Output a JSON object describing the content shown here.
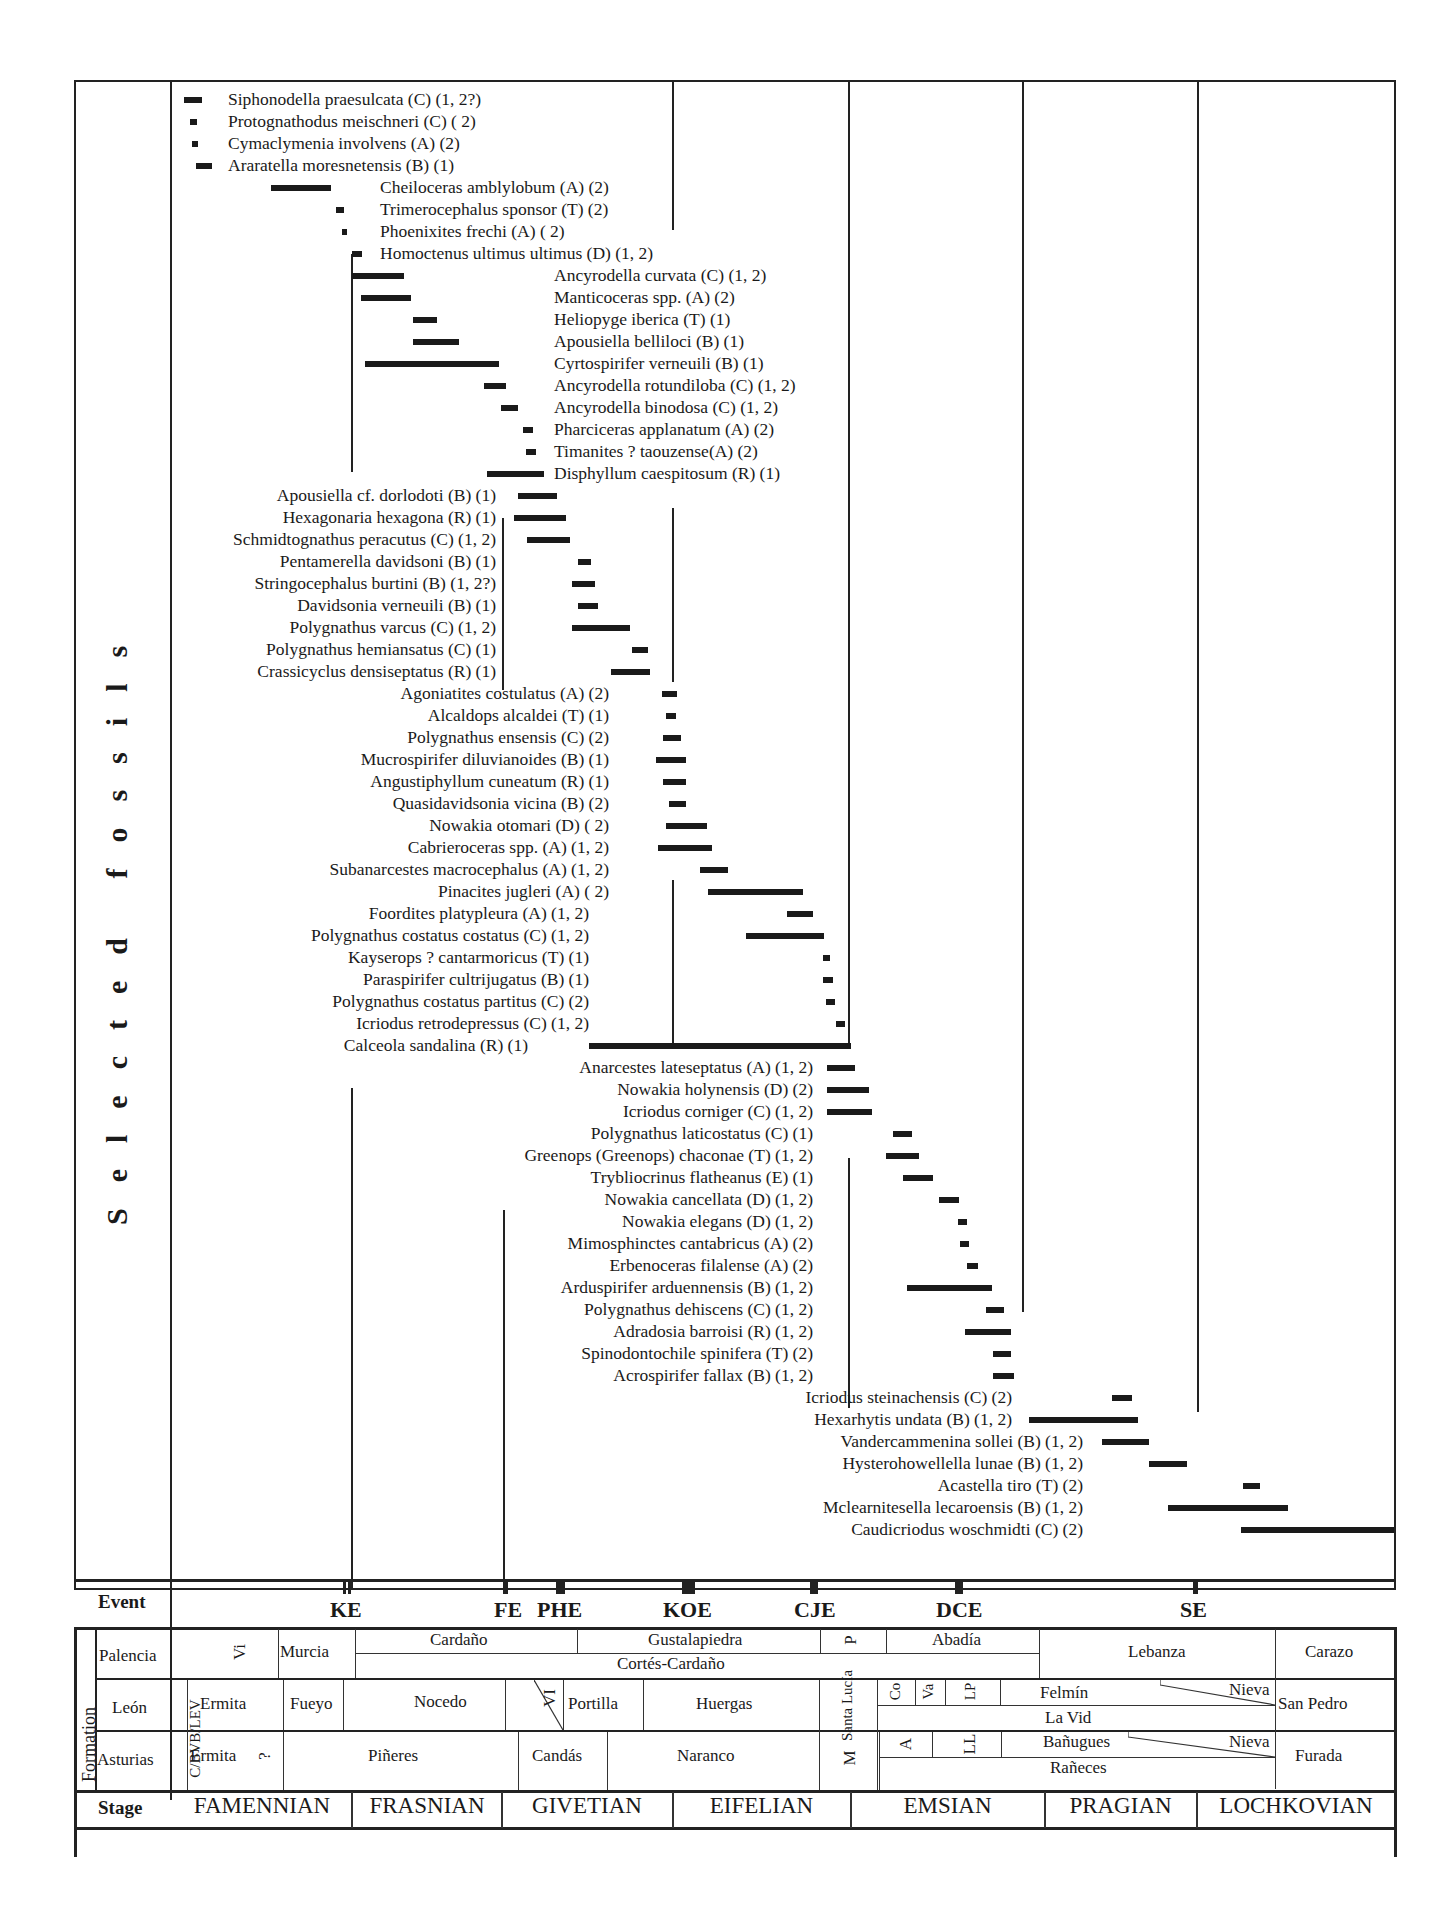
{
  "chart_data": {
    "type": "range-chart",
    "title": "",
    "ylabel": "Selected fossils",
    "x_axis": {
      "direction": "young-to-old left-to-right",
      "stages": [
        "FAMENNIAN",
        "FRASNIAN",
        "GIVETIAN",
        "EIFELIAN",
        "EMSIAN",
        "PRAGIAN",
        "LOCHKOVIAN"
      ]
    },
    "events": [
      "KE",
      "FE",
      "PHE",
      "KOE",
      "CJE",
      "DCE",
      "SE"
    ],
    "taxa": [
      {
        "name": "Siphonodella praesulcata (C) (1, 2?)",
        "x0": 184,
        "x1": 202,
        "y": 100,
        "side": "right",
        "lx": 228
      },
      {
        "name": "Protognathodus meischneri (C) ( 2)",
        "x0": 190,
        "x1": 197,
        "y": 122,
        "side": "right",
        "lx": 228
      },
      {
        "name": "Cymaclymenia involvens (A) (2)",
        "x0": 192,
        "x1": 198,
        "y": 144,
        "side": "right",
        "lx": 228
      },
      {
        "name": "Araratella moresnetensis (B) (1)",
        "x0": 196,
        "x1": 212,
        "y": 166,
        "side": "right",
        "lx": 228
      },
      {
        "name": "Cheiloceras amblylobum (A) (2)",
        "x0": 271,
        "x1": 331,
        "y": 188,
        "side": "right",
        "lx": 380
      },
      {
        "name": "Trimerocephalus sponsor (T) (2)",
        "x0": 336,
        "x1": 344,
        "y": 210,
        "side": "right",
        "lx": 380
      },
      {
        "name": "Phoenixites frechi (A) ( 2)",
        "x0": 342,
        "x1": 346,
        "y": 232,
        "side": "right",
        "lx": 380
      },
      {
        "name": "Homoctenus ultimus ultimus (D) (1, 2)",
        "x0": 352,
        "x1": 362,
        "y": 254,
        "side": "right",
        "lx": 380
      },
      {
        "name": "Ancyrodella curvata (C) (1, 2)",
        "x0": 352,
        "x1": 404,
        "y": 276,
        "side": "right",
        "lx": 554
      },
      {
        "name": "Manticoceras spp. (A) (2)",
        "x0": 361,
        "x1": 411,
        "y": 298,
        "side": "right",
        "lx": 554
      },
      {
        "name": "Heliopyge iberica (T) (1)",
        "x0": 413,
        "x1": 437,
        "y": 320,
        "side": "right",
        "lx": 554
      },
      {
        "name": "Apousiella belliloci (B) (1)",
        "x0": 413,
        "x1": 459,
        "y": 342,
        "side": "right",
        "lx": 554
      },
      {
        "name": "Cyrtospirifer verneuili (B) (1)",
        "x0": 365,
        "x1": 499,
        "y": 364,
        "side": "right",
        "lx": 554
      },
      {
        "name": "Ancyrodella rotundiloba (C) (1, 2)",
        "x0": 484,
        "x1": 506,
        "y": 386,
        "side": "right",
        "lx": 554
      },
      {
        "name": "Ancyrodella binodosa (C) (1, 2)",
        "x0": 501,
        "x1": 518,
        "y": 408,
        "side": "right",
        "lx": 554
      },
      {
        "name": "Pharciceras applanatum (A) (2)",
        "x0": 523,
        "x1": 533,
        "y": 430,
        "side": "right",
        "lx": 554
      },
      {
        "name": "Timanites ? taouzense(A) (2)",
        "x0": 526,
        "x1": 536,
        "y": 452,
        "side": "right",
        "lx": 554
      },
      {
        "name": "Disphyllum caespitosum (R) (1)",
        "x0": 487,
        "x1": 544,
        "y": 474,
        "side": "right",
        "lx": 554
      },
      {
        "name": "Apousiella cf. dorlodoti (B) (1)",
        "x0": 518,
        "x1": 557,
        "y": 496,
        "side": "left",
        "lx": 496
      },
      {
        "name": "Hexagonaria hexagona (R) (1)",
        "x0": 514,
        "x1": 566,
        "y": 518,
        "side": "left",
        "lx": 496
      },
      {
        "name": "Schmidtognathus peracutus (C) (1, 2)",
        "x0": 527,
        "x1": 570,
        "y": 540,
        "side": "left",
        "lx": 496
      },
      {
        "name": "Pentamerella davidsoni (B) (1)",
        "x0": 578,
        "x1": 591,
        "y": 562,
        "side": "left",
        "lx": 496
      },
      {
        "name": "Stringocephalus burtini (B) (1, 2?)",
        "x0": 572,
        "x1": 595,
        "y": 584,
        "side": "left",
        "lx": 496
      },
      {
        "name": "Davidsonia verneuili (B) (1)",
        "x0": 578,
        "x1": 598,
        "y": 606,
        "side": "left",
        "lx": 496
      },
      {
        "name": "Polygnathus varcus (C) (1, 2)",
        "x0": 572,
        "x1": 630,
        "y": 628,
        "side": "left",
        "lx": 496
      },
      {
        "name": "Polygnathus hemiansatus (C) (1)",
        "x0": 632,
        "x1": 648,
        "y": 650,
        "side": "left",
        "lx": 496
      },
      {
        "name": "Crassicyclus densiseptatus (R) (1)",
        "x0": 611,
        "x1": 650,
        "y": 672,
        "side": "left",
        "lx": 496
      },
      {
        "name": "Agoniatites costulatus (A) (2)",
        "x0": 662,
        "x1": 677,
        "y": 694,
        "side": "left",
        "lx": 609
      },
      {
        "name": "Alcaldops alcaldei (T) (1)",
        "x0": 666,
        "x1": 676,
        "y": 716,
        "side": "left",
        "lx": 609
      },
      {
        "name": "Polygnathus ensensis (C) (2)",
        "x0": 663,
        "x1": 681,
        "y": 738,
        "side": "left",
        "lx": 609
      },
      {
        "name": "Mucrospirifer diluvianoides (B) (1)",
        "x0": 656,
        "x1": 686,
        "y": 760,
        "side": "left",
        "lx": 609
      },
      {
        "name": "Angustiphyllum cuneatum (R) (1)",
        "x0": 663,
        "x1": 686,
        "y": 782,
        "side": "left",
        "lx": 609
      },
      {
        "name": "Quasidavidsonia vicina (B) (2)",
        "x0": 669,
        "x1": 686,
        "y": 804,
        "side": "left",
        "lx": 609
      },
      {
        "name": "Nowakia otomari (D) ( 2)",
        "x0": 666,
        "x1": 707,
        "y": 826,
        "side": "left",
        "lx": 609
      },
      {
        "name": "Cabrieroceras spp.  (A) (1, 2)",
        "x0": 658,
        "x1": 712,
        "y": 848,
        "side": "left",
        "lx": 609
      },
      {
        "name": "Subanarcestes macrocephalus (A) (1, 2)",
        "x0": 700,
        "x1": 728,
        "y": 870,
        "side": "left",
        "lx": 609
      },
      {
        "name": "Pinacites jugleri (A) ( 2)",
        "x0": 708,
        "x1": 803,
        "y": 892,
        "side": "left",
        "lx": 609
      },
      {
        "name": "Foordites platypleura (A) (1, 2)",
        "x0": 787,
        "x1": 813,
        "y": 914,
        "side": "left",
        "lx": 589
      },
      {
        "name": "Polygnathus costatus costatus (C) (1, 2)",
        "x0": 746,
        "x1": 824,
        "y": 936,
        "side": "left",
        "lx": 589
      },
      {
        "name": "Kayserops ? cantarmoricus (T) (1)",
        "x0": 823,
        "x1": 830,
        "y": 958,
        "side": "left",
        "lx": 589
      },
      {
        "name": "Paraspirifer cultrijugatus (B) (1)",
        "x0": 823,
        "x1": 833,
        "y": 980,
        "side": "left",
        "lx": 589
      },
      {
        "name": "Polygnathus costatus partitus (C) (2)",
        "x0": 826,
        "x1": 835,
        "y": 1002,
        "side": "left",
        "lx": 589
      },
      {
        "name": "Icriodus retrodepressus (C) (1, 2)",
        "x0": 836,
        "x1": 845,
        "y": 1024,
        "side": "left",
        "lx": 589
      },
      {
        "name": "Calceola sandalina (R) (1)",
        "x0": 589,
        "x1": 851,
        "y": 1046,
        "side": "left",
        "lx": 528
      },
      {
        "name": "Anarcestes lateseptatus (A) (1, 2)",
        "x0": 827,
        "x1": 855,
        "y": 1068,
        "side": "left",
        "lx": 813
      },
      {
        "name": "Nowakia holynensis (D) (2)",
        "x0": 827,
        "x1": 869,
        "y": 1090,
        "side": "left",
        "lx": 813
      },
      {
        "name": "Icriodus corniger (C) (1, 2)",
        "x0": 827,
        "x1": 872,
        "y": 1112,
        "side": "left",
        "lx": 813
      },
      {
        "name": "Polygnathus laticostatus (C) (1)",
        "x0": 893,
        "x1": 912,
        "y": 1134,
        "side": "left",
        "lx": 813
      },
      {
        "name": "Greenops (Greenops) chaconae (T) (1, 2)",
        "x0": 886,
        "x1": 919,
        "y": 1156,
        "side": "left",
        "lx": 813
      },
      {
        "name": "Trybliocrinus flatheanus (E) (1)",
        "x0": 903,
        "x1": 933,
        "y": 1178,
        "side": "left",
        "lx": 813
      },
      {
        "name": "Nowakia cancellata (D) (1, 2)",
        "x0": 939,
        "x1": 959,
        "y": 1200,
        "side": "left",
        "lx": 813
      },
      {
        "name": "Nowakia elegans (D) (1, 2)",
        "x0": 958,
        "x1": 967,
        "y": 1222,
        "side": "left",
        "lx": 813
      },
      {
        "name": "Mimosphinctes cantabricus (A) (2)",
        "x0": 960,
        "x1": 969,
        "y": 1244,
        "side": "left",
        "lx": 813
      },
      {
        "name": "Erbenoceras filalense (A) (2)",
        "x0": 967,
        "x1": 978,
        "y": 1266,
        "side": "left",
        "lx": 813
      },
      {
        "name": "Arduspirifer arduennensis (B) (1, 2)",
        "x0": 907,
        "x1": 992,
        "y": 1288,
        "side": "left",
        "lx": 813
      },
      {
        "name": "Polygnathus dehiscens (C) (1, 2)",
        "x0": 986,
        "x1": 1004,
        "y": 1310,
        "side": "left",
        "lx": 813
      },
      {
        "name": "Adradosia barroisi (R) (1, 2)",
        "x0": 965,
        "x1": 1011,
        "y": 1332,
        "side": "left",
        "lx": 813
      },
      {
        "name": "Spinodontochile spinifera (T) (2)",
        "x0": 993,
        "x1": 1011,
        "y": 1354,
        "side": "left",
        "lx": 813
      },
      {
        "name": "Acrospirifer fallax (B) (1, 2)",
        "x0": 993,
        "x1": 1014,
        "y": 1376,
        "side": "left",
        "lx": 813
      },
      {
        "name": "Icriodus steinachensis (C) (2)",
        "x0": 1112,
        "x1": 1132,
        "y": 1398,
        "side": "left",
        "lx": 1012
      },
      {
        "name": "Hexarhytis undata (B) (1, 2)",
        "x0": 1029,
        "x1": 1138,
        "y": 1420,
        "side": "left",
        "lx": 1012
      },
      {
        "name": "Vandercammenina sollei (B) (1, 2)",
        "x0": 1102,
        "x1": 1149,
        "y": 1442,
        "side": "left",
        "lx": 1083
      },
      {
        "name": "Hysterohowellella lunae (B) (1, 2)",
        "x0": 1149,
        "x1": 1187,
        "y": 1464,
        "side": "left",
        "lx": 1083
      },
      {
        "name": "Acastella tiro (T) (2)",
        "x0": 1243,
        "x1": 1260,
        "y": 1486,
        "side": "left",
        "lx": 1083
      },
      {
        "name": "Mclearnitesella lecaroensis (B) (1, 2)",
        "x0": 1168,
        "x1": 1288,
        "y": 1508,
        "side": "left",
        "lx": 1083
      },
      {
        "name": "Caudicriodus woschmidti (C) (2)",
        "x0": 1241,
        "x1": 1394,
        "y": 1530,
        "side": "left",
        "lx": 1083
      }
    ]
  },
  "side_title": "Selected fossils",
  "event_row": {
    "label": "Event",
    "events": [
      {
        "name": "KE",
        "tick_x": 343,
        "tick_w": 8,
        "double": true,
        "label_x": 330
      },
      {
        "name": "FE",
        "tick_x": 503,
        "tick_w": 5,
        "double": false,
        "label_x": 494
      },
      {
        "name": "PHE",
        "tick_x": 556,
        "tick_w": 9,
        "double": false,
        "label_x": 537
      },
      {
        "name": "KOE",
        "tick_x": 682,
        "tick_w": 13,
        "double": false,
        "label_x": 663
      },
      {
        "name": "CJE",
        "tick_x": 810,
        "tick_w": 8,
        "double": false,
        "label_x": 794
      },
      {
        "name": "DCE",
        "tick_x": 955,
        "tick_w": 8,
        "double": false,
        "label_x": 936
      },
      {
        "name": "SE",
        "tick_x": 1193,
        "tick_w": 5,
        "double": false,
        "label_x": 1180
      }
    ]
  },
  "formation": {
    "label": "Formation",
    "rows": [
      {
        "region": "Palencia",
        "units": [
          "Vi",
          "Murcia",
          "Cardaño",
          "Gustalapiedra",
          "Cortés-Cardaño",
          "P",
          "Abadía",
          "Lebanza",
          "Carazo"
        ]
      },
      {
        "region": "León",
        "units": [
          "C/BVB/LEV",
          "Ermita",
          "Fueyo",
          "Nocedo",
          "VI",
          "Portilla",
          "Huergas",
          "Santa Lucía",
          "Co",
          "Va",
          "LP",
          "Felmín",
          "Nieva",
          "La Vid",
          "San Pedro"
        ]
      },
      {
        "region": "Asturias",
        "units": [
          "Ermita",
          "?",
          "Piñeres",
          "Candás",
          "Naranco",
          "M",
          "A",
          "LL",
          "Bañugues",
          "Nieva",
          "Rañeces",
          "Furada"
        ]
      }
    ]
  },
  "stage_row": {
    "label": "Stage",
    "stages": [
      "FAMENNIAN",
      "FRASNIAN",
      "GIVETIAN",
      "EIFELIAN",
      "EMSIAN",
      "PRAGIAN",
      "LOCHKOVIAN"
    ]
  }
}
